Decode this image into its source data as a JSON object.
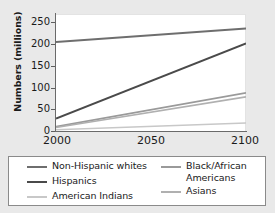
{
  "chart_data": {
    "type": "line",
    "title": "",
    "xlabel": "",
    "ylabel": "Numbers (millions)",
    "x": [
      2000,
      2100
    ],
    "xlim": [
      2000,
      2100
    ],
    "ylim": [
      0,
      260
    ],
    "xticks": [
      "2000",
      "2050",
      "2100"
    ],
    "xtick_values": [
      2000,
      2050,
      2100
    ],
    "yticks": [
      "0",
      "50",
      "100",
      "150",
      "200",
      "250"
    ],
    "ytick_values": [
      0,
      50,
      100,
      150,
      200,
      250
    ],
    "grid": false,
    "legend_position": "below",
    "series": [
      {
        "name": "Non-Hispanic whites",
        "values": [
          200,
          230
        ],
        "color": "#6e6e6e",
        "width": 2.0
      },
      {
        "name": "Hispanics",
        "values": [
          30,
          197
        ],
        "color": "#4a4a4a",
        "width": 2.0
      },
      {
        "name": "American Indians",
        "values": [
          5,
          20
        ],
        "color": "#c8c8c8",
        "width": 1.6
      },
      {
        "name": "Black/African Americans",
        "values": [
          12,
          87
        ],
        "color": "#9a9a9a",
        "width": 1.6
      },
      {
        "name": "Asians",
        "values": [
          10,
          78
        ],
        "color": "#b0b0b0",
        "width": 1.6
      }
    ]
  },
  "axis": {
    "ylabel": "Numbers (millions)",
    "ytick_0": "0",
    "ytick_1": "50",
    "ytick_2": "100",
    "ytick_3": "150",
    "ytick_4": "200",
    "ytick_5": "250",
    "xtick_0": "2000",
    "xtick_1": "2050",
    "xtick_2": "2100"
  },
  "legend": {
    "left": [
      {
        "label": "Non-Hispanic whites",
        "color": "#6e6e6e",
        "thickness": "2px"
      },
      {
        "label": "Hispanics",
        "color": "#4a4a4a",
        "thickness": "2px"
      },
      {
        "label": "American Indians",
        "color": "#c8c8c8",
        "thickness": "2px"
      }
    ],
    "right": [
      {
        "label": "Black/African\nAmericans",
        "color": "#9a9a9a",
        "thickness": "2px"
      },
      {
        "label": "Asians",
        "color": "#b0b0b0",
        "thickness": "2px"
      }
    ]
  },
  "colors": {
    "background": "#e9e9e9",
    "plot_background": "#ffffff",
    "axis": "#6a6a6a",
    "text": "#1a1a1a",
    "legend_border": "#8a8a8a"
  }
}
